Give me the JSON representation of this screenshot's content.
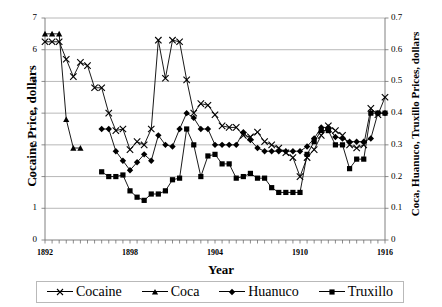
{
  "chart_data": {
    "type": "line",
    "title": "",
    "xlabel": "Year",
    "ylabel_left": "Cocaine Price, dollars",
    "ylabel_right": "Coca, Huanuco, Truxillo Prices, dollars",
    "grid": true,
    "legend_position": "bottom",
    "xlim": [
      1892,
      1916
    ],
    "ylim_left": [
      0,
      7
    ],
    "ylim_right": [
      0,
      0.7
    ],
    "x_tick_labels": [
      "1892",
      "1898",
      "1904",
      "1910",
      "1916"
    ],
    "x_tick_values": [
      1892,
      1898,
      1904,
      1910,
      1916
    ],
    "x_minor_tick_step": 0.5,
    "y_left_tick_labels": [
      "0",
      "1",
      "2",
      "3",
      "4",
      "5",
      "6",
      "7"
    ],
    "y_left_tick_values": [
      0,
      1,
      2,
      3,
      4,
      5,
      6,
      7
    ],
    "y_right_tick_labels": [
      "0",
      "0.1",
      "0.2",
      "0.3",
      "0.4",
      "0.5",
      "0.6",
      "0.7"
    ],
    "y_right_tick_values": [
      0,
      0.1,
      0.2,
      0.3,
      0.4,
      0.5,
      0.6,
      0.7
    ],
    "series": [
      {
        "name": "Cocaine",
        "axis": "left",
        "marker": "x",
        "x": [
          1892.0,
          1892.5,
          1893.0,
          1893.5,
          1894.0,
          1894.5,
          1895.0,
          1895.5,
          1896.0,
          1896.5,
          1897.0,
          1897.5,
          1898.0,
          1898.5,
          1899.0,
          1899.5,
          1900.0,
          1900.5,
          1901.0,
          1901.5,
          1902.0,
          1902.5,
          1903.0,
          1903.5,
          1904.0,
          1904.5,
          1905.0,
          1905.5,
          1906.0,
          1906.5,
          1907.0,
          1907.5,
          1908.0,
          1908.5,
          1909.0,
          1909.5,
          1910.0,
          1910.5,
          1911.0,
          1911.5,
          1912.0,
          1912.5,
          1913.0,
          1913.5,
          1914.0,
          1914.5,
          1915.0,
          1915.5,
          1916.0
        ],
        "y": [
          6.25,
          6.25,
          6.25,
          5.7,
          5.15,
          5.6,
          5.5,
          4.8,
          4.8,
          4.0,
          3.45,
          3.5,
          2.85,
          3.1,
          3.0,
          3.5,
          6.3,
          5.1,
          6.3,
          6.25,
          5.05,
          4.0,
          4.3,
          4.25,
          3.95,
          3.6,
          3.55,
          3.55,
          3.3,
          3.25,
          3.4,
          3.1,
          3.0,
          2.9,
          2.75,
          2.6,
          2.0,
          2.6,
          2.85,
          3.3,
          3.6,
          3.45,
          3.3,
          3.0,
          2.9,
          3.0,
          4.15,
          3.95,
          4.5
        ]
      },
      {
        "name": "Coca",
        "axis": "right",
        "marker": "triangle",
        "x": [
          1892.0,
          1892.5,
          1893.0,
          1893.5,
          1894.0,
          1894.5
        ],
        "y": [
          0.65,
          0.65,
          0.65,
          0.38,
          0.29,
          0.29
        ]
      },
      {
        "name": "Huanuco",
        "axis": "right",
        "marker": "diamond",
        "x": [
          1896.0,
          1896.5,
          1897.0,
          1897.5,
          1898.0,
          1898.5,
          1899.0,
          1899.5,
          1900.0,
          1900.5,
          1901.0,
          1901.5,
          1902.0,
          1902.5,
          1903.0,
          1903.5,
          1904.0,
          1904.5,
          1905.0,
          1905.5,
          1906.0,
          1906.5,
          1907.0,
          1907.5,
          1908.0,
          1908.5,
          1909.0,
          1909.5,
          1910.0,
          1910.5,
          1911.0,
          1911.5,
          1912.0,
          1912.5,
          1913.0,
          1913.5,
          1914.0,
          1914.5,
          1915.0,
          1915.5,
          1916.0
        ],
        "y": [
          0.35,
          0.35,
          0.28,
          0.25,
          0.22,
          0.245,
          0.27,
          0.25,
          0.33,
          0.3,
          0.295,
          0.35,
          0.4,
          0.385,
          0.35,
          0.35,
          0.3,
          0.3,
          0.3,
          0.3,
          0.34,
          0.315,
          0.29,
          0.28,
          0.28,
          0.28,
          0.28,
          0.28,
          0.28,
          0.295,
          0.32,
          0.355,
          0.355,
          0.325,
          0.32,
          0.31,
          0.31,
          0.31,
          0.32,
          0.4,
          0.4
        ]
      },
      {
        "name": "Truxillo",
        "axis": "right",
        "marker": "square",
        "x": [
          1896.0,
          1896.5,
          1897.0,
          1897.5,
          1898.0,
          1898.5,
          1899.0,
          1899.5,
          1900.0,
          1900.5,
          1901.0,
          1901.5,
          1902.0,
          1902.5,
          1903.0,
          1903.5,
          1904.0,
          1904.5,
          1905.0,
          1905.5,
          1906.0,
          1906.5,
          1907.0,
          1907.5,
          1908.0,
          1908.5,
          1909.0,
          1909.5,
          1910.0,
          1910.5,
          1911.0,
          1911.5,
          1912.0,
          1912.5,
          1913.0,
          1913.5,
          1914.0,
          1914.5,
          1915.0,
          1915.5,
          1916.0
        ],
        "y": [
          0.215,
          0.2,
          0.2,
          0.205,
          0.155,
          0.135,
          0.125,
          0.145,
          0.145,
          0.155,
          0.19,
          0.195,
          0.35,
          0.3,
          0.2,
          0.265,
          0.27,
          0.24,
          0.24,
          0.195,
          0.2,
          0.21,
          0.195,
          0.195,
          0.165,
          0.15,
          0.15,
          0.15,
          0.15,
          0.27,
          0.31,
          0.345,
          0.345,
          0.3,
          0.3,
          0.225,
          0.255,
          0.255,
          0.4,
          0.4,
          0.4
        ]
      }
    ],
    "legend": [
      {
        "label": "Cocaine",
        "marker": "x"
      },
      {
        "label": "Coca",
        "marker": "triangle"
      },
      {
        "label": "Huanuco",
        "marker": "diamond"
      },
      {
        "label": "Truxillo",
        "marker": "square"
      }
    ]
  }
}
